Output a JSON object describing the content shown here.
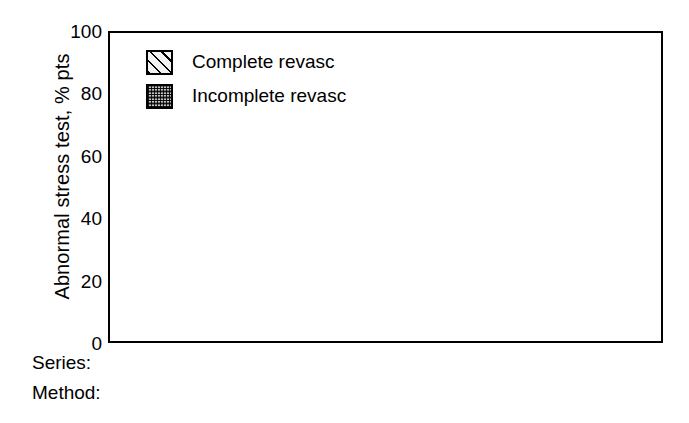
{
  "chart_data": {
    "type": "bar",
    "title": "",
    "xlabel": "",
    "ylabel": "Abnormal stress test, % pts",
    "ylim": [
      0,
      100
    ],
    "yticks": [
      100,
      80,
      60,
      40,
      20,
      0
    ],
    "grid": false,
    "legend_position": "top-left",
    "categories": [
      "Thomas / ECG",
      "Deligonul / ECG",
      "De Feyter / ECG",
      "De Feyter / Thallium"
    ],
    "series": [
      {
        "name": "Complete revasc",
        "values": [
          19,
          10,
          14.5,
          22
        ]
      },
      {
        "name": "Incomplete revasc",
        "values": [
          33.5,
          35.5,
          33,
          32
        ]
      }
    ],
    "axis_rows": [
      {
        "title": "Series:",
        "cells": [
          {
            "label": "Thomas",
            "span": 1
          },
          {
            "label": "Deligonul",
            "span": 1
          },
          {
            "label": "De Feyter",
            "span": 2
          }
        ]
      },
      {
        "title": "Method:",
        "cells": [
          {
            "label": "ECG",
            "span": 1
          },
          {
            "label": "ECG",
            "span": 1
          },
          {
            "label": "ECG",
            "span": 1
          },
          {
            "label": "Thallium",
            "span": 1
          }
        ]
      }
    ]
  },
  "legend": {
    "items": [
      {
        "label": "Complete revasc",
        "pattern": "diagonal-hatch",
        "color": "#f2f2f2"
      },
      {
        "label": "Incomplete revasc",
        "pattern": "dotted-fill",
        "color": "#7a7a7a"
      }
    ]
  },
  "yaxis": {
    "label": "Abnormal stress test, % pts",
    "ticks": [
      "100",
      "80",
      "60",
      "40",
      "20",
      "0"
    ]
  },
  "rows": {
    "series_title": "Series:",
    "method_title": "Method:"
  },
  "colors": {
    "axis": "#000000",
    "background": "#ffffff",
    "complete": "#f2f2f2",
    "incomplete": "#7a7a7a"
  }
}
